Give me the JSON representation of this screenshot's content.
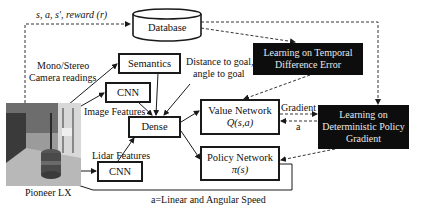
{
  "diagram": {
    "nodes": {
      "database": {
        "label": "Database"
      },
      "semantics": {
        "label": "Semantics"
      },
      "cnn_camera": {
        "label": "CNN"
      },
      "cnn_lidar": {
        "label": "CNN"
      },
      "dense": {
        "label": "Dense"
      },
      "value_network": {
        "label": "Value Network",
        "sublabel": "Q(s,a)"
      },
      "policy_network": {
        "label": "Policy Network",
        "sublabel": "π(s)"
      },
      "td_learning": {
        "line1": "Learning on Temporal",
        "line2": "Difference Error"
      },
      "dpg_learning": {
        "line1": "Learning on",
        "line2": "Deterministic Policy",
        "line3": "Gradient"
      },
      "robot": {
        "label": "Pioneer LX"
      }
    },
    "edge_labels": {
      "transition": "s, a, s', reward (r)",
      "camera_line1": "Mono/Stereo",
      "camera_line2": "Camera readings",
      "goal_line1": "Distance to goal,",
      "goal_line2": "angle to goal",
      "image_features": "Image Features",
      "lidar_features": "Lidar Features",
      "gradient": "Gradient",
      "action": "a",
      "action_def": "a=Linear and Angular Speed"
    },
    "colors": {
      "line": "#1a1a1a",
      "dark_box": "#0d0d0d",
      "dark_text": "#e8e8e8"
    }
  }
}
